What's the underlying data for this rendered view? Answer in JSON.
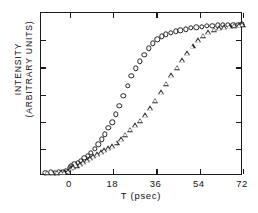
{
  "figure": {
    "background": "#ffffff",
    "axis_color": "#1a1a1a"
  },
  "chart_data": {
    "type": "scatter",
    "title": "",
    "xlabel": "T (psec)",
    "ylabel_line1": "INTENSITY",
    "ylabel_line2": "(ARBITRARY UNITS)",
    "xlim": [
      -12,
      72
    ],
    "ylim": [
      0,
      1.06
    ],
    "xticks": [
      0,
      18,
      36,
      54,
      72
    ],
    "xticklabels": [
      "0",
      "18",
      "36",
      "54",
      "72"
    ],
    "yticks": [
      0.0,
      0.176,
      0.353,
      0.529,
      0.706,
      0.882
    ],
    "yticklabels": [
      "",
      "",
      "",
      "",
      "",
      ""
    ],
    "grid": false,
    "legend": "none",
    "series": [
      {
        "name": "open-circles",
        "marker": "circle",
        "points": [
          [
            -10.2,
            0.022
          ],
          [
            -8.0,
            0.025
          ],
          [
            -6.2,
            0.022
          ],
          [
            -4.6,
            0.025
          ],
          [
            -3.0,
            0.028
          ],
          [
            -1.6,
            0.03
          ],
          [
            0.0,
            0.055
          ],
          [
            0.6,
            0.062
          ],
          [
            1.8,
            0.075
          ],
          [
            3.2,
            0.085
          ],
          [
            4.6,
            0.1
          ],
          [
            6.0,
            0.118
          ],
          [
            7.4,
            0.132
          ],
          [
            8.8,
            0.152
          ],
          [
            10.4,
            0.178
          ],
          [
            11.8,
            0.205
          ],
          [
            13.2,
            0.238
          ],
          [
            14.6,
            0.272
          ],
          [
            16.0,
            0.312
          ],
          [
            17.6,
            0.35
          ],
          [
            19.0,
            0.4
          ],
          [
            20.6,
            0.455
          ],
          [
            22.2,
            0.52
          ],
          [
            24.0,
            0.585
          ],
          [
            25.6,
            0.65
          ],
          [
            27.4,
            0.7
          ],
          [
            29.2,
            0.745
          ],
          [
            31.0,
            0.79
          ],
          [
            32.8,
            0.83
          ],
          [
            34.6,
            0.862
          ],
          [
            36.4,
            0.888
          ],
          [
            38.2,
            0.908
          ],
          [
            40.0,
            0.922
          ],
          [
            42.0,
            0.932
          ],
          [
            44.0,
            0.94
          ],
          [
            46.0,
            0.948
          ],
          [
            48.2,
            0.955
          ],
          [
            50.4,
            0.962
          ],
          [
            52.6,
            0.968
          ],
          [
            54.8,
            0.972
          ],
          [
            57.0,
            0.976
          ],
          [
            59.2,
            0.978
          ],
          [
            61.4,
            0.98
          ],
          [
            63.6,
            0.982
          ],
          [
            65.8,
            0.983
          ],
          [
            68.0,
            0.984
          ],
          [
            70.0,
            0.985
          ],
          [
            71.6,
            0.986
          ]
        ]
      },
      {
        "name": "open-triangles",
        "marker": "triangle",
        "points": [
          [
            -9.4,
            0.02
          ],
          [
            -7.2,
            0.022
          ],
          [
            -5.4,
            0.02
          ],
          [
            -3.8,
            0.024
          ],
          [
            -2.2,
            0.026
          ],
          [
            -0.8,
            0.03
          ],
          [
            0.4,
            0.05
          ],
          [
            1.4,
            0.058
          ],
          [
            2.8,
            0.068
          ],
          [
            4.2,
            0.078
          ],
          [
            5.6,
            0.09
          ],
          [
            7.0,
            0.102
          ],
          [
            8.4,
            0.115
          ],
          [
            9.8,
            0.128
          ],
          [
            11.2,
            0.142
          ],
          [
            12.8,
            0.155
          ],
          [
            14.4,
            0.168
          ],
          [
            16.0,
            0.18
          ],
          [
            17.6,
            0.192
          ],
          [
            19.4,
            0.215
          ],
          [
            21.2,
            0.24
          ],
          [
            23.0,
            0.268
          ],
          [
            25.0,
            0.3
          ],
          [
            27.0,
            0.33
          ],
          [
            29.0,
            0.358
          ],
          [
            31.2,
            0.395
          ],
          [
            33.4,
            0.44
          ],
          [
            35.6,
            0.49
          ],
          [
            37.8,
            0.545
          ],
          [
            40.0,
            0.6
          ],
          [
            42.2,
            0.655
          ],
          [
            44.4,
            0.705
          ],
          [
            46.6,
            0.752
          ],
          [
            48.8,
            0.8
          ],
          [
            51.0,
            0.845
          ],
          [
            53.2,
            0.882
          ],
          [
            55.4,
            0.912
          ],
          [
            57.6,
            0.935
          ],
          [
            59.8,
            0.95
          ],
          [
            62.0,
            0.96
          ],
          [
            64.2,
            0.968
          ],
          [
            66.4,
            0.973
          ],
          [
            68.4,
            0.978
          ],
          [
            70.4,
            0.982
          ],
          [
            71.8,
            0.984
          ]
        ]
      }
    ]
  }
}
